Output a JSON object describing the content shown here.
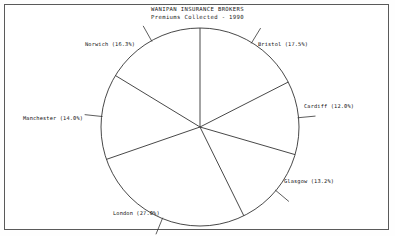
{
  "title": {
    "line1": "WANIPAN INSURANCE BROKERS",
    "line2": "Premiums Collected - 1990"
  },
  "colors": {
    "border": "#5a5a5a",
    "ink": "#111111",
    "pie_outline": "#333333",
    "background": "#ffffff"
  },
  "chart_data": {
    "type": "pie",
    "title": "WANIPAN INSURANCE BROKERS",
    "subtitle": "Premiums Collected - 1990",
    "xlabel": "",
    "ylabel": "",
    "legend_position": "external-labels",
    "grid": false,
    "start_angle_deg": 0,
    "direction": "clockwise",
    "unit": "percent",
    "categories": [
      "Bristol",
      "Cardiff",
      "Glasgow",
      "London",
      "Manchester",
      "Norwich"
    ],
    "values": [
      17.5,
      12.0,
      13.2,
      27.0,
      14.0,
      16.3
    ],
    "total": 100.0,
    "slices": [
      {
        "label": "Bristol",
        "value": 17.5,
        "text": "Bristol (17.5%)",
        "lx": 258,
        "ly": 41,
        "anchor": "left"
      },
      {
        "label": "Cardiff",
        "value": 12.0,
        "text": "Cardiff (12.0%)",
        "lx": 304,
        "ly": 103,
        "anchor": "left"
      },
      {
        "label": "Glasgow",
        "value": 13.2,
        "text": "Glasgow (13.2%)",
        "lx": 284,
        "ly": 178,
        "anchor": "left"
      },
      {
        "label": "London",
        "value": 27.0,
        "text": "London (27.0%)",
        "lx": 113,
        "ly": 210,
        "anchor": "left"
      },
      {
        "label": "Manchester",
        "value": 14.0,
        "text": "Manchester (14.0%)",
        "lx": 23,
        "ly": 115,
        "anchor": "left"
      },
      {
        "label": "Norwich",
        "value": 16.3,
        "text": "Norwich (16.3%)",
        "lx": 85,
        "ly": 41,
        "anchor": "left"
      }
    ]
  },
  "geometry": {
    "cx": 200,
    "cy": 127,
    "r": 99
  }
}
